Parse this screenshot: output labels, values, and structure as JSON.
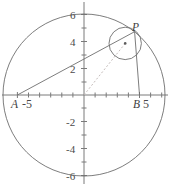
{
  "figure": {
    "background_color": "#ffffff",
    "stroke_color": "#6e6e6e",
    "axis_color": "#7a7a7a",
    "dash_color": "#b9b0ae",
    "label_color": "#4a4a4a"
  },
  "axes": {
    "x_tick_labels": [
      "-5",
      "5"
    ],
    "y_tick_labels": [
      "6",
      "4",
      "2",
      "-2",
      "-4",
      "-6"
    ],
    "x_ticks": [
      -6,
      -5,
      -4,
      -3,
      -2,
      -1,
      1,
      2,
      3,
      4,
      5,
      6
    ],
    "y_ticks": [
      -6,
      -5,
      -4,
      -3,
      -2,
      -1,
      1,
      2,
      3,
      4,
      5,
      6
    ],
    "x_range": [
      -6.6,
      6.4
    ],
    "y_range": [
      -6.6,
      6.6
    ],
    "grid": false
  },
  "points": {
    "A": {
      "label": "A",
      "x": -5,
      "y": 0
    },
    "B": {
      "label": "B",
      "x": 5,
      "y": 0
    },
    "P": {
      "label": "P",
      "x": 3.75,
      "y": 4.69
    },
    "center_dot": {
      "label": "",
      "x": 3.05,
      "y": 3.82
    }
  },
  "shapes": {
    "big_circle": {
      "cx": 0,
      "cy": 0,
      "r": 6
    },
    "small_circle": {
      "cx": 3.05,
      "cy": 3.82,
      "r": 1.2
    },
    "chord_AP": {
      "from": "A",
      "to": "P"
    },
    "chord_BP": {
      "from": "B",
      "to": "P"
    },
    "dashed_radius": {
      "from": "origin",
      "to": "center_dot"
    }
  },
  "tick_labels_x": {
    "minus5": "-5",
    "five": "5"
  }
}
